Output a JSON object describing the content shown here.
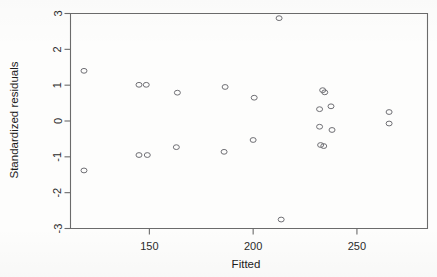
{
  "chart_data": {
    "type": "scatter",
    "title": "",
    "xlabel": "Fitted",
    "ylabel": "Standardized residuals",
    "xlim": [
      112,
      284
    ],
    "ylim": [
      -3,
      3
    ],
    "xticks": [
      150,
      200,
      250
    ],
    "xtick_labels": [
      "150",
      "200",
      "250"
    ],
    "yticks": [
      -3,
      -2,
      -1,
      0,
      1,
      2,
      3
    ],
    "ytick_labels": [
      "-3",
      "-2",
      "-1",
      "0",
      "1",
      "2",
      "3"
    ],
    "grid": false,
    "legend": null,
    "marker": "open-circle",
    "points": [
      {
        "x": 118.5,
        "y": 1.4
      },
      {
        "x": 118.5,
        "y": -1.38
      },
      {
        "x": 145.0,
        "y": 1.01
      },
      {
        "x": 148.5,
        "y": 1.01
      },
      {
        "x": 145.0,
        "y": -0.95
      },
      {
        "x": 149.0,
        "y": -0.95
      },
      {
        "x": 163.5,
        "y": 0.79
      },
      {
        "x": 163.0,
        "y": -0.73
      },
      {
        "x": 186.5,
        "y": 0.95
      },
      {
        "x": 186.0,
        "y": -0.86
      },
      {
        "x": 200.5,
        "y": 0.65
      },
      {
        "x": 200.0,
        "y": -0.53
      },
      {
        "x": 212.5,
        "y": 2.87
      },
      {
        "x": 213.5,
        "y": -2.75
      },
      {
        "x": 233.5,
        "y": 0.86
      },
      {
        "x": 234.5,
        "y": 0.8
      },
      {
        "x": 232.0,
        "y": 0.33
      },
      {
        "x": 237.5,
        "y": 0.41
      },
      {
        "x": 232.0,
        "y": -0.16
      },
      {
        "x": 238.0,
        "y": -0.25
      },
      {
        "x": 232.5,
        "y": -0.67
      },
      {
        "x": 234.0,
        "y": -0.7
      },
      {
        "x": 265.5,
        "y": 0.25
      },
      {
        "x": 265.5,
        "y": -0.07
      }
    ]
  },
  "axes": {
    "x_title": "Fitted",
    "y_title": "Standardized residuals"
  }
}
